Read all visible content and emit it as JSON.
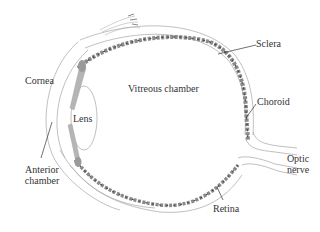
{
  "diagram": {
    "labels": {
      "cornea": "Cornea",
      "vitreous": "Vitreous chamber",
      "lens": "Lens",
      "sclera": "Sclera",
      "choroid": "Choroid",
      "anterior_line1": "Anterior",
      "anterior_line2": "chamber",
      "optic_line1": "Optic",
      "optic_line2": "nerve",
      "retina": "Retina"
    },
    "colors": {
      "outline": "#a8a8a8",
      "choroid_fill": "#8a8a8a",
      "choroid_dark": "#4a4a4a",
      "iris_fill": "#b5b5b5",
      "leader_line": "#333333",
      "text": "#333333"
    }
  }
}
